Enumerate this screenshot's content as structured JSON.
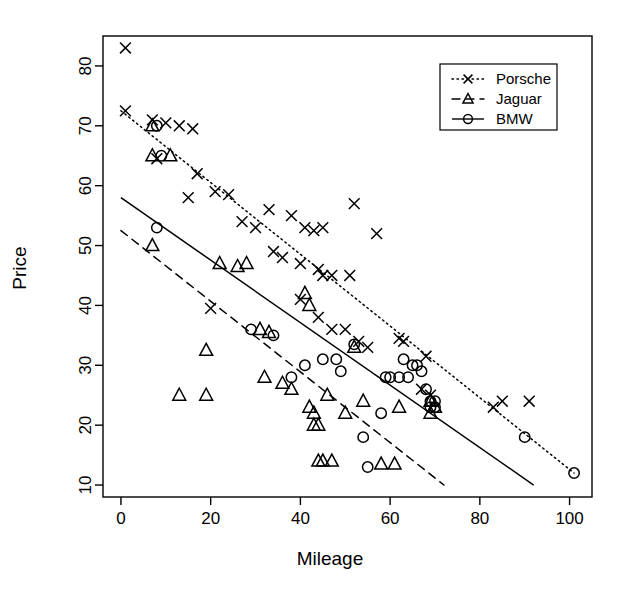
{
  "chart_data": {
    "type": "scatter",
    "title": "",
    "xlabel": "Mileage",
    "ylabel": "Price",
    "xlim": [
      -4,
      105
    ],
    "ylim": [
      8,
      85
    ],
    "xticks": [
      0,
      20,
      40,
      60,
      80,
      100
    ],
    "yticks": [
      10,
      20,
      30,
      40,
      50,
      60,
      70,
      80
    ],
    "grid": false,
    "legend_position": "top-right",
    "series": [
      {
        "name": "Porsche",
        "marker": "x",
        "line_style": "dotted",
        "color": "#000000",
        "points": [
          [
            1,
            83
          ],
          [
            1,
            72.5
          ],
          [
            7,
            71
          ],
          [
            10,
            70.5
          ],
          [
            13,
            70
          ],
          [
            16,
            69.5
          ],
          [
            8,
            64.5
          ],
          [
            17,
            62
          ],
          [
            15,
            58
          ],
          [
            21,
            59
          ],
          [
            24,
            58.5
          ],
          [
            27,
            54
          ],
          [
            30,
            53
          ],
          [
            33,
            56
          ],
          [
            38,
            55
          ],
          [
            41,
            53
          ],
          [
            43,
            52.5
          ],
          [
            45,
            53
          ],
          [
            52,
            57
          ],
          [
            57,
            52
          ],
          [
            34,
            49
          ],
          [
            36,
            48
          ],
          [
            40,
            47
          ],
          [
            44,
            46
          ],
          [
            45,
            45
          ],
          [
            47,
            45
          ],
          [
            51,
            45
          ],
          [
            20,
            39.5
          ],
          [
            40,
            41
          ],
          [
            44,
            38
          ],
          [
            47,
            36
          ],
          [
            50,
            36
          ],
          [
            53,
            34
          ],
          [
            55,
            33
          ],
          [
            62,
            34.5
          ],
          [
            63,
            34
          ],
          [
            68,
            31.5
          ],
          [
            67,
            26
          ],
          [
            69,
            25
          ],
          [
            83,
            23
          ],
          [
            85,
            24
          ],
          [
            91,
            24
          ]
        ],
        "fit_line": {
          "x0": 0,
          "y0": 72.5,
          "x1": 101,
          "y1": 12
        }
      },
      {
        "name": "Jaguar",
        "marker": "triangle",
        "line_style": "dashed",
        "color": "#000000",
        "points": [
          [
            7,
            70
          ],
          [
            7,
            65
          ],
          [
            11,
            65
          ],
          [
            7,
            50
          ],
          [
            13,
            25
          ],
          [
            19,
            32.5
          ],
          [
            19,
            25
          ],
          [
            22,
            47
          ],
          [
            26,
            46.5
          ],
          [
            28,
            47
          ],
          [
            31,
            36
          ],
          [
            33,
            35.5
          ],
          [
            32,
            28
          ],
          [
            36,
            27
          ],
          [
            38,
            26
          ],
          [
            41,
            42
          ],
          [
            42,
            40
          ],
          [
            42,
            23
          ],
          [
            43,
            22
          ],
          [
            43,
            20
          ],
          [
            44,
            20
          ],
          [
            44,
            14
          ],
          [
            45,
            14
          ],
          [
            47,
            14
          ],
          [
            46,
            25
          ],
          [
            50,
            22
          ],
          [
            52,
            33
          ],
          [
            54,
            24
          ],
          [
            58,
            13.5
          ],
          [
            61,
            13.5
          ],
          [
            62,
            23
          ],
          [
            69,
            22
          ],
          [
            69,
            24
          ],
          [
            70,
            23
          ]
        ],
        "fit_line": {
          "x0": 0,
          "y0": 52.5,
          "x1": 72,
          "y1": 10
        }
      },
      {
        "name": "BMW",
        "marker": "circle",
        "line_style": "solid",
        "color": "#000000",
        "points": [
          [
            8,
            70
          ],
          [
            9,
            65
          ],
          [
            8,
            53
          ],
          [
            29,
            36
          ],
          [
            34,
            35
          ],
          [
            38,
            28
          ],
          [
            41,
            30
          ],
          [
            45,
            31
          ],
          [
            48,
            31
          ],
          [
            49,
            29
          ],
          [
            52,
            33.5
          ],
          [
            54,
            18
          ],
          [
            55,
            13
          ],
          [
            58,
            22
          ],
          [
            59,
            28
          ],
          [
            60,
            28
          ],
          [
            62,
            28
          ],
          [
            63,
            31
          ],
          [
            64,
            28
          ],
          [
            65,
            30
          ],
          [
            66,
            30
          ],
          [
            67,
            29
          ],
          [
            68,
            26
          ],
          [
            69,
            24
          ],
          [
            69,
            23
          ],
          [
            70,
            23
          ],
          [
            70,
            24
          ],
          [
            90,
            18
          ],
          [
            101,
            12
          ]
        ],
        "fit_line": {
          "x0": 0,
          "y0": 58,
          "x1": 92,
          "y1": 10
        }
      }
    ],
    "legend_entries": [
      {
        "label": "Porsche",
        "marker": "x",
        "line_style": "dotted"
      },
      {
        "label": "Jaguar",
        "marker": "triangle",
        "line_style": "dashed"
      },
      {
        "label": "BMW",
        "marker": "circle",
        "line_style": "solid"
      }
    ]
  }
}
